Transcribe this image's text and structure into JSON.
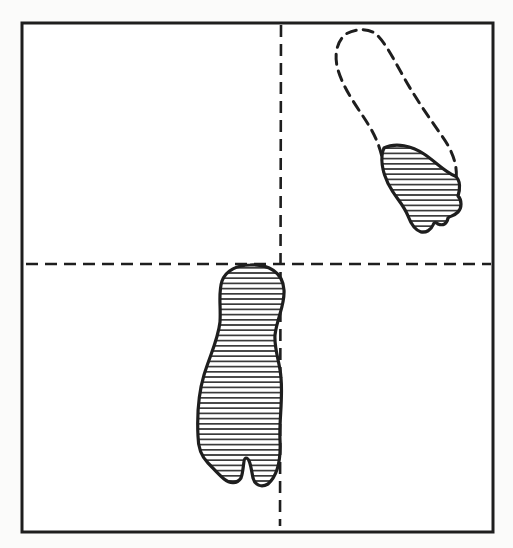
{
  "figure": {
    "type": "footprint-diagram",
    "colors": {
      "background": "#fbfbfa",
      "ink": "#1e1e1e",
      "hatch": "#2a2a2a",
      "paper": "#ffffff"
    },
    "frame": {
      "x": 22,
      "y": 23,
      "width": 471,
      "height": 509
    },
    "axes": {
      "horizontal_y": 264,
      "vertical_x": 281,
      "style": "dashed"
    },
    "footprints": [
      {
        "id": "center-footprint",
        "label": "full foot print",
        "fill": "horizontal-hatch",
        "outline": "solid",
        "quadrant": "lower-left, straddling vertical axis"
      },
      {
        "id": "upper-right-forefoot",
        "label": "forefoot print",
        "fill": "horizontal-hatch",
        "outline": "solid",
        "quadrant": "upper-right"
      },
      {
        "id": "upper-right-heel-outline",
        "label": "missing heel outline",
        "fill": "none",
        "outline": "dashed",
        "quadrant": "upper-right"
      }
    ]
  }
}
